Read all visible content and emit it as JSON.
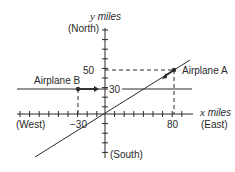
{
  "diagram": {
    "y_axis": {
      "var": "y",
      "unit": " miles",
      "direction": "(North)",
      "bottom_direction": "(South)"
    },
    "x_axis": {
      "var": "x",
      "unit": " miles",
      "direction": "(East)",
      "left_direction": "(West)"
    },
    "ticks": {
      "y50": "50",
      "y30": "30",
      "xneg30": "−30",
      "x80": "80"
    },
    "airplane_a": {
      "label": "Airplane A",
      "x": 80,
      "y": 50,
      "heading": "southwest toward origin"
    },
    "airplane_b": {
      "label": "Airplane B",
      "x": -30,
      "y": 30,
      "heading": "east"
    }
  },
  "colors": {
    "ink": "#2a2a2a",
    "background": "#ffffff"
  }
}
